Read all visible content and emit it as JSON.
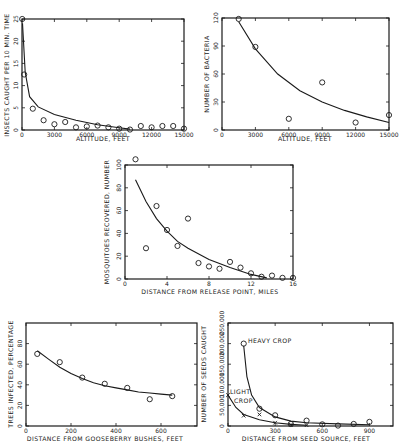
{
  "chart_data": [
    {
      "id": "insects",
      "type": "scatter",
      "title": "",
      "xlabel": "ALTITUDE, FEET",
      "ylabel": "INSECTS CAUGHT PER 10 MIN. TIME",
      "xlim": [
        0,
        15000
      ],
      "ylim": [
        0,
        25
      ],
      "xticks": [
        "0",
        "3000",
        "6000",
        "9000",
        "12000",
        "15000"
      ],
      "yticks": [
        "0",
        "5",
        "10",
        "15",
        "20",
        "25"
      ],
      "grid": false,
      "points": {
        "x": [
          20,
          200,
          1000,
          2000,
          3000,
          4000,
          5000,
          6000,
          7000,
          8000,
          9000,
          10000,
          11000,
          12000,
          13000,
          14000,
          15000
        ],
        "y": [
          25,
          12.5,
          4.8,
          2.2,
          1.3,
          1.8,
          0.6,
          0.8,
          1.0,
          0.6,
          0.3,
          0.1,
          0.9,
          0.6,
          0.9,
          0.9,
          0.3
        ]
      },
      "fit_curve": {
        "x": [
          50,
          300,
          700,
          1500,
          3000,
          5000,
          7000,
          9000,
          10000
        ],
        "y": [
          24,
          13,
          7.5,
          5.2,
          3.5,
          2.2,
          1.2,
          0.5,
          0.2
        ]
      }
    },
    {
      "id": "bacteria",
      "type": "scatter",
      "title": "",
      "xlabel": "ALTITUDE, FEET",
      "ylabel": "NUMBER OF BACTERIA",
      "xlim": [
        0,
        15000
      ],
      "ylim": [
        0,
        120
      ],
      "xticks": [
        "0",
        "3000",
        "6000",
        "9000",
        "12000",
        "15000"
      ],
      "yticks": [
        "0",
        "30",
        "60",
        "90",
        "120"
      ],
      "grid": false,
      "points": {
        "x": [
          1500,
          3000,
          6000,
          9000,
          12000,
          15000
        ],
        "y": [
          119,
          89,
          12,
          51,
          8,
          16
        ]
      },
      "fit_curve": {
        "x": [
          1500,
          3000,
          5000,
          7000,
          9000,
          11000,
          13000,
          15000
        ],
        "y": [
          116,
          87,
          60,
          42,
          30,
          21,
          14,
          8
        ]
      }
    },
    {
      "id": "mosquitoes",
      "type": "scatter",
      "title": "",
      "xlabel": "DISTANCE FROM RELEASE POINT, MILES",
      "ylabel": "MOSQUITOES RECOVERED, NUMBER",
      "xlim": [
        0,
        16
      ],
      "ylim": [
        0,
        100
      ],
      "xticks": [
        "0",
        "4",
        "8",
        "12",
        "16"
      ],
      "yticks": [
        "0",
        "20",
        "40",
        "60",
        "80",
        "100"
      ],
      "grid": false,
      "points": {
        "x": [
          1,
          2,
          3,
          4,
          5,
          6,
          7,
          8,
          9,
          10,
          11,
          12,
          13,
          14,
          15,
          16
        ],
        "y": [
          105,
          27,
          64,
          43,
          29,
          53,
          14,
          11,
          9,
          15,
          10,
          5,
          2,
          3,
          1,
          1
        ]
      },
      "fit_curve": {
        "x": [
          1,
          2,
          3,
          4,
          5,
          6,
          8,
          10,
          12,
          13.5
        ],
        "y": [
          87,
          68,
          53,
          42,
          33,
          27,
          17,
          10,
          4,
          1
        ]
      }
    },
    {
      "id": "blister-rust",
      "type": "scatter",
      "title": "",
      "xlabel": "DISTANCE FROM GOOSEBERRY BUSHES, FEET",
      "ylabel": "TREES INFECTED, PERCENTAGE",
      "xlim": [
        0,
        760
      ],
      "ylim": [
        0,
        100
      ],
      "xticks": [
        "0",
        "200",
        "400",
        "600"
      ],
      "yticks": [
        "0",
        "20",
        "40",
        "60",
        "80"
      ],
      "grid": false,
      "points": {
        "x": [
          50,
          150,
          250,
          350,
          450,
          550,
          650
        ],
        "y": [
          70,
          62,
          47,
          41,
          37,
          26,
          29
        ]
      },
      "fit_curve": {
        "x": [
          50,
          100,
          150,
          200,
          250,
          300,
          350,
          400,
          450,
          500,
          550,
          600,
          650
        ],
        "y": [
          73,
          65,
          57,
          51,
          46,
          42,
          39,
          37,
          35,
          33,
          32,
          31,
          30
        ]
      }
    },
    {
      "id": "seeds",
      "type": "scatter",
      "title": "",
      "xlabel": "DISTANCE FROM SEED SOURCE, FEET",
      "ylabel": "NUMBER OF SEEDS CAUGHT",
      "xlim": [
        0,
        1050
      ],
      "ylim": [
        0,
        250000
      ],
      "xticks": [
        "0",
        "300",
        "600",
        "900"
      ],
      "yticks": [
        "0",
        "50,000",
        "100,000",
        "150,000",
        "200,000",
        "250,000"
      ],
      "grid": false,
      "annotations": [
        "HEAVY CROP",
        "LIGHT CROP"
      ],
      "series": [
        {
          "name": "HEAVY CROP",
          "marker": "circle",
          "x": [
            100,
            200,
            300,
            400,
            500,
            600,
            700,
            800,
            900
          ],
          "y": [
            200000,
            42000,
            26000,
            5000,
            13000,
            4000,
            1000,
            5000,
            10000
          ]
        },
        {
          "name": "LIGHT CROP",
          "marker": "x",
          "x": [
            0,
            100,
            200,
            300,
            400,
            500
          ],
          "y": [
            75000,
            25000,
            28000,
            8000,
            3000,
            2000
          ]
        }
      ],
      "fit_curves": [
        {
          "name": "HEAVY CROP",
          "x": [
            100,
            120,
            150,
            200,
            300,
            400,
            500,
            700,
            900
          ],
          "y": [
            195000,
            120000,
            75000,
            45000,
            22000,
            12000,
            8000,
            5000,
            3000
          ]
        },
        {
          "name": "LIGHT CROP",
          "x": [
            0,
            50,
            100,
            200,
            300,
            400,
            500
          ],
          "y": [
            75000,
            45000,
            28000,
            15000,
            8000,
            4000,
            2000
          ]
        }
      ]
    }
  ],
  "labels": {
    "c1": {
      "x": "ALTITUDE, FEET",
      "y": "INSECTS CAUGHT PER 10 MIN. TIME"
    },
    "c2": {
      "x": "ALTITUDE, FEET",
      "y": "NUMBER OF BACTERIA"
    },
    "c3": {
      "x": "DISTANCE  FROM RELEASE POINT, MILES",
      "y": "MOSQUITOES RECOVERED, NUMBER"
    },
    "c4": {
      "x": "DISTANCE FROM GOOSEBERRY BUSHES, FEET",
      "y": "TREES INFECTED, PERCENTAGE"
    },
    "c5": {
      "x": "DISTANCE FROM SEED SOURCE, FEET",
      "y": "NUMBER OF SEEDS CAUGHT",
      "heavy": "HEAVY CROP",
      "light1": "LIGHT",
      "light2": "CROP"
    }
  }
}
